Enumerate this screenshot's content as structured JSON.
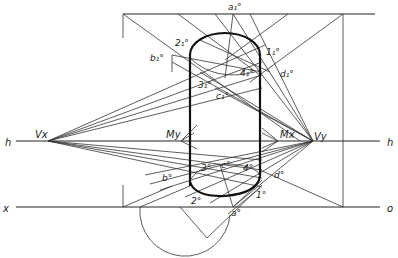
{
  "diagram": {
    "type": "perspective-construction",
    "lines": {
      "horizon": {
        "label_left": "h",
        "label_right": "h"
      },
      "ground": {
        "label_left": "x",
        "label_right": "o"
      }
    },
    "vanishing_points": {
      "left": "Vx",
      "right": "Vy"
    },
    "measuring_points": {
      "left": "Mx",
      "right": "My"
    },
    "upper_points": {
      "a": "a₁°",
      "b": "b₁°",
      "c": "c₁°",
      "d": "d₁°",
      "p1": "1₁°",
      "p2": "2₁°",
      "p3": "3₁°",
      "p4": "4₁°"
    },
    "lower_points": {
      "a": "a°",
      "b": "b°",
      "c": "c°",
      "d": "d°",
      "p1": "1°",
      "p2": "2°",
      "p3": "3°",
      "p4": "4°"
    },
    "colors": {
      "line": "#333333",
      "outline": "#111111",
      "background": "#ffffff"
    }
  }
}
